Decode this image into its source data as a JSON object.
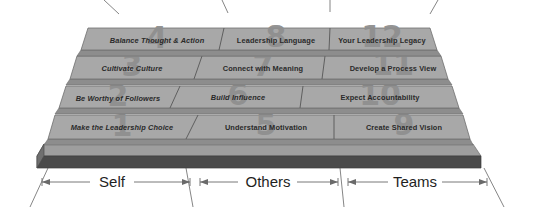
{
  "diagram": {
    "type": "leadership-pyramid-3d",
    "title": "",
    "colors": {
      "tile_face": "#a8a8a8",
      "tile_edge": "#8d8d8d",
      "slab_front": "#4a4a4a",
      "slab_left": "#6f6f6f",
      "ghost_number": "#8f8f8f",
      "label_text": "#2a2a2a",
      "background": "#ffffff"
    },
    "rows": [
      {
        "row_index": 0,
        "tiles": [
          {
            "number": "4",
            "label": "Balance Thought & Action",
            "column": "Self",
            "italic": true
          },
          {
            "number": "8",
            "label": "Leadership Language",
            "column": "Others",
            "italic": false
          },
          {
            "number": "12",
            "label": "Your Leadership Legacy",
            "column": "Teams",
            "italic": false
          }
        ]
      },
      {
        "row_index": 1,
        "tiles": [
          {
            "number": "3",
            "label": "Cultivate Culture",
            "column": "Self",
            "italic": true
          },
          {
            "number": "7",
            "label": "Connect with Meaning",
            "column": "Others",
            "italic": false
          },
          {
            "number": "11",
            "label": "Develop a Process View",
            "column": "Teams",
            "italic": false
          }
        ]
      },
      {
        "row_index": 2,
        "tiles": [
          {
            "number": "2",
            "label": "Be Worthy of Followers",
            "column": "Self",
            "italic": true
          },
          {
            "number": "6",
            "label": "Build Influence",
            "column": "Others",
            "italic": true
          },
          {
            "number": "10",
            "label": "Expect Accountability",
            "column": "Teams",
            "italic": false
          }
        ]
      },
      {
        "row_index": 3,
        "tiles": [
          {
            "number": "1",
            "label": "Make the Leadership Choice",
            "column": "Self",
            "italic": true
          },
          {
            "number": "5",
            "label": "Understand Motivation",
            "column": "Others",
            "italic": false
          },
          {
            "number": "9",
            "label": "Create Shared Vision",
            "column": "Teams",
            "italic": false
          }
        ]
      }
    ],
    "axis": {
      "segments": [
        {
          "label": "Self"
        },
        {
          "label": "Others"
        },
        {
          "label": "Teams"
        }
      ]
    }
  }
}
